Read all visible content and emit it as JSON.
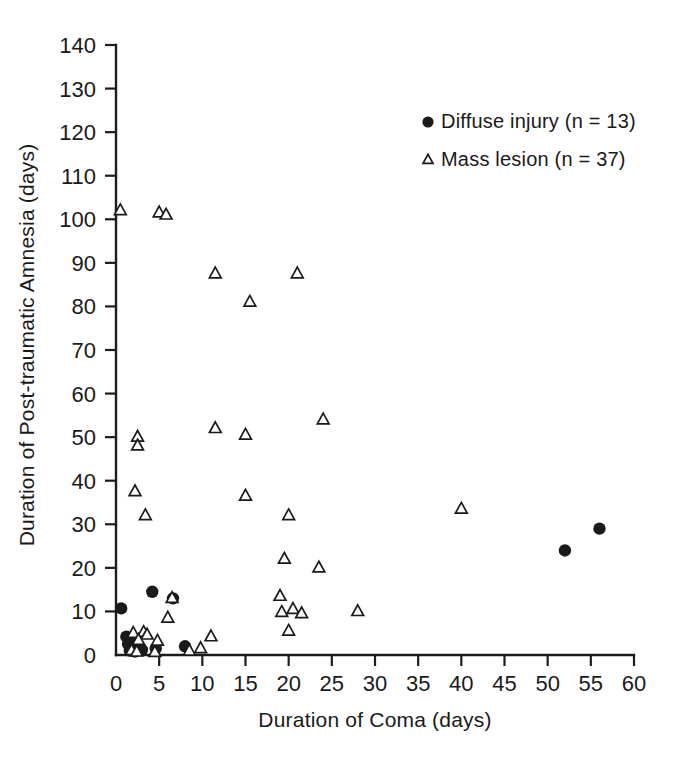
{
  "chart_data": {
    "type": "scatter",
    "title": "",
    "xlabel": "Duration of Coma (days)",
    "ylabel": "Duration of Post-traumatic Amnesia (days)",
    "xlim": [
      0,
      60
    ],
    "ylim": [
      0,
      140
    ],
    "xticks": [
      0,
      5,
      10,
      15,
      20,
      25,
      30,
      35,
      40,
      45,
      50,
      55,
      60
    ],
    "yticks": [
      0,
      10,
      20,
      30,
      40,
      50,
      60,
      70,
      80,
      90,
      100,
      110,
      120,
      130,
      140
    ],
    "xtick_labels": [
      "0",
      "5",
      "10",
      "15",
      "20",
      "25",
      "30",
      "35",
      "40",
      "45",
      "50",
      "55",
      "60"
    ],
    "ytick_labels": [
      "0",
      "10",
      "20",
      "30",
      "40",
      "50",
      "60",
      "70",
      "80",
      "90",
      "100",
      "110",
      "120",
      "130",
      "140"
    ],
    "grid": false,
    "legend_position": "upper-right-inside",
    "series": [
      {
        "name": "Diffuse injury (n = 13)",
        "marker": "filled-circle",
        "color": "#1a1a1a",
        "n": 13,
        "points": [
          [
            0.6,
            10.7
          ],
          [
            1.2,
            4.2
          ],
          [
            1.4,
            2.5
          ],
          [
            1.6,
            1.0
          ],
          [
            2.0,
            3.0
          ],
          [
            2.2,
            0.8
          ],
          [
            3.0,
            1.2
          ],
          [
            4.2,
            14.5
          ],
          [
            4.6,
            1.5
          ],
          [
            6.6,
            13.0
          ],
          [
            8.0,
            2.0
          ],
          [
            52.0,
            24.0
          ],
          [
            56.0,
            29.0
          ]
        ]
      },
      {
        "name": "Mass lesion (n = 37)",
        "marker": "open-triangle",
        "color": "#1a1a1a",
        "n": 37,
        "points": [
          [
            0.5,
            102.0
          ],
          [
            5.0,
            101.5
          ],
          [
            5.8,
            101.0
          ],
          [
            11.5,
            87.5
          ],
          [
            21.0,
            87.5
          ],
          [
            15.5,
            81.0
          ],
          [
            24.0,
            54.0
          ],
          [
            11.5,
            52.0
          ],
          [
            15.0,
            50.5
          ],
          [
            2.5,
            50.0
          ],
          [
            2.5,
            48.0
          ],
          [
            2.2,
            37.5
          ],
          [
            15.0,
            36.5
          ],
          [
            40.0,
            33.5
          ],
          [
            3.4,
            32.0
          ],
          [
            20.0,
            32.0
          ],
          [
            23.5,
            20.0
          ],
          [
            19.5,
            22.0
          ],
          [
            19.0,
            13.5
          ],
          [
            6.5,
            13.0
          ],
          [
            28.0,
            10.0
          ],
          [
            19.2,
            9.8
          ],
          [
            20.5,
            10.5
          ],
          [
            21.5,
            9.5
          ],
          [
            6.0,
            8.5
          ],
          [
            20.0,
            5.5
          ],
          [
            2.0,
            5.0
          ],
          [
            3.2,
            5.2
          ],
          [
            3.6,
            4.6
          ],
          [
            2.6,
            3.4
          ],
          [
            11.0,
            4.2
          ],
          [
            9.8,
            1.5
          ],
          [
            1.8,
            1.0
          ],
          [
            2.4,
            0.7
          ],
          [
            4.5,
            0.6
          ],
          [
            8.5,
            0.9
          ],
          [
            4.8,
            3.2
          ]
        ]
      }
    ],
    "legend": [
      {
        "label": "Diffuse injury (n = 13)",
        "marker": "filled-circle"
      },
      {
        "label": "Mass lesion (n = 37)",
        "marker": "open-triangle"
      }
    ]
  },
  "figure": {
    "background": "#ffffff",
    "foreground": "#1a1a1a"
  }
}
